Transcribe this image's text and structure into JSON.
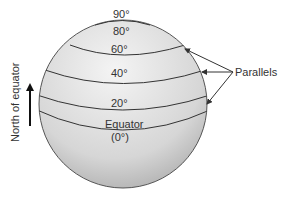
{
  "diagram": {
    "labels": {
      "lat90": "90°",
      "lat80": "80°",
      "lat60": "60°",
      "lat40": "40°",
      "lat20": "20°",
      "equator": "Equator",
      "equator_deg": "(0°)",
      "parallels": "Parallels",
      "north": "North of equator"
    },
    "colors": {
      "sphere_light": "#f2f2f2",
      "sphere_dark": "#b8b8b8",
      "line": "#333333"
    }
  }
}
